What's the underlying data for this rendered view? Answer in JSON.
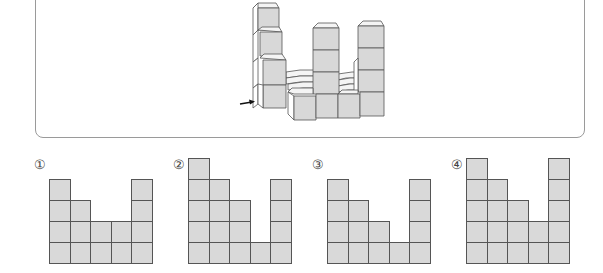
{
  "figure": {
    "arrow": "right-arrow",
    "colors": {
      "front_face": "#d8d8d8",
      "top_face": "#f4f4f4",
      "side_face": "#ffffff",
      "edge": "#555555"
    }
  },
  "options": [
    {
      "label": "①",
      "column_heights": [
        4,
        3,
        2,
        2,
        4
      ]
    },
    {
      "label": "②",
      "column_heights": [
        5,
        4,
        3,
        1,
        4
      ]
    },
    {
      "label": "③",
      "column_heights": [
        4,
        3,
        2,
        1,
        4
      ]
    },
    {
      "label": "④",
      "column_heights": [
        5,
        4,
        3,
        2,
        5
      ]
    }
  ],
  "colors": {
    "cell_fill": "#d9d9d9",
    "cell_border": "#555555",
    "frame_border": "#9a9a9a"
  }
}
